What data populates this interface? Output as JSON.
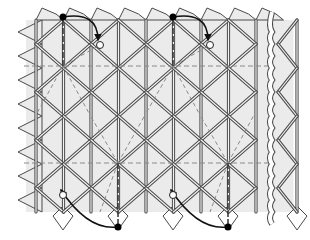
{
  "diagram": {
    "type": "triangle-twist-tessellation",
    "colors": {
      "background": "#ffffff",
      "fill": "#ebebeb",
      "fold_line": "#4a4a4a",
      "fold_line_inner": "#f2f2f2",
      "dashed": "#8a8a8a",
      "arrow": "#111111",
      "dot_black": "#000000",
      "dot_white": "#ffffff"
    },
    "grid": {
      "x0": 36,
      "dx": 27.5,
      "cols": 10,
      "y_rows": [
        44,
        92,
        140,
        188
      ],
      "row_half": 24,
      "top": 20,
      "bottom": 212
    },
    "dashed_horizontal_y": [
      66,
      163
    ],
    "break_line_x": 272,
    "arrows": [
      {
        "from": [
          63,
          17
        ],
        "to": [
          100,
          45
        ],
        "direction": "down-right"
      },
      {
        "from": [
          173,
          17
        ],
        "to": [
          210,
          45
        ],
        "direction": "down-right"
      },
      {
        "from": [
          118,
          227
        ],
        "to": [
          63,
          195
        ],
        "direction": "up-left"
      },
      {
        "from": [
          228,
          227
        ],
        "to": [
          173,
          195
        ],
        "direction": "up-left"
      }
    ],
    "black_dots": [
      [
        63,
        17
      ],
      [
        173,
        17
      ],
      [
        118,
        227
      ],
      [
        228,
        227
      ]
    ],
    "white_dots": [
      [
        100,
        45
      ],
      [
        210,
        45
      ],
      [
        63,
        195
      ],
      [
        173,
        195
      ]
    ]
  }
}
